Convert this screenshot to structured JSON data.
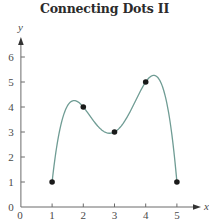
{
  "chart_data": {
    "type": "line",
    "title": "Connecting Dots II",
    "xlabel": "x",
    "ylabel": "y",
    "xlim": [
      0,
      5.8
    ],
    "ylim": [
      0,
      6.8
    ],
    "x_ticks": [
      1,
      2,
      3,
      4,
      5
    ],
    "x_tick_labels": [
      "0",
      "1",
      "2",
      "3",
      "4",
      "5"
    ],
    "y_ticks": [
      1,
      2,
      3,
      4,
      5,
      6
    ],
    "y_tick_labels": [
      "0",
      "1",
      "2",
      "3",
      "4",
      "5",
      "6"
    ],
    "grid": false,
    "legend": null,
    "series": [
      {
        "name": "points",
        "kind": "scatter",
        "x": [
          1,
          2,
          3,
          4,
          5
        ],
        "y": [
          1,
          4,
          3,
          5,
          1
        ],
        "color": "#1a1a1a"
      },
      {
        "name": "interpolating polynomial",
        "kind": "curve",
        "description": "Smooth degree-4 curve passing through all five points",
        "x_range": [
          1,
          5
        ],
        "local_max_1": [
          2.3,
          4.56
        ],
        "local_min": [
          3.33,
          2.16
        ],
        "local_max_2": [
          4.35,
          6.56
        ],
        "color": "#6f9c94"
      }
    ]
  },
  "colors": {
    "axis": "#6b6b6b",
    "curve": "#6f9c94",
    "dots": "#1a1a1a"
  }
}
